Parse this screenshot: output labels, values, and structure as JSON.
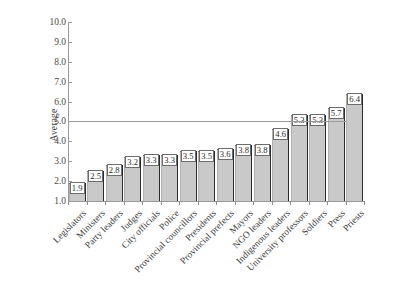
{
  "chart_data": {
    "type": "bar",
    "title": "",
    "xlabel": "",
    "ylabel": "Average",
    "ylim": [
      1.0,
      10.0
    ],
    "yticks": [
      "10.0",
      "9.0",
      "8.0",
      "7.0",
      "6.0",
      "5.0",
      "4.0",
      "3.0",
      "2.0",
      "1.0"
    ],
    "grid": false,
    "legend": null,
    "reference_line": {
      "value": 5.0,
      "label": ""
    },
    "categories": [
      "Legislators",
      "Ministers",
      "Party leaders",
      "Judges",
      "City officials",
      "Police",
      "Provincial councillors",
      "Presidents",
      "Provincial prefects",
      "Mayors",
      "NGO leaders",
      "Indigenous leaders",
      "University professors",
      "Soldiers",
      "Press",
      "Priests"
    ],
    "values": [
      1.9,
      2.5,
      2.8,
      3.2,
      3.3,
      3.3,
      3.5,
      3.5,
      3.6,
      3.8,
      3.8,
      4.6,
      5.3,
      5.3,
      5.7,
      6.4
    ],
    "value_labels": [
      "1.9",
      "2.5",
      "2.8",
      "3.2",
      "3.3",
      "3.3",
      "3.5",
      "3.5",
      "3.6",
      "3.8",
      "3.8",
      "4.6",
      "5.3",
      "5.3",
      "5.7",
      "6.4"
    ]
  },
  "colors": {
    "bar_fill": "#c9c9c9",
    "bar_edge": "#2b2b2b",
    "axis": "#9a9a9a",
    "reference_line": "#9b9b9b",
    "text": "#3a3a3a",
    "background": "#ffffff"
  }
}
